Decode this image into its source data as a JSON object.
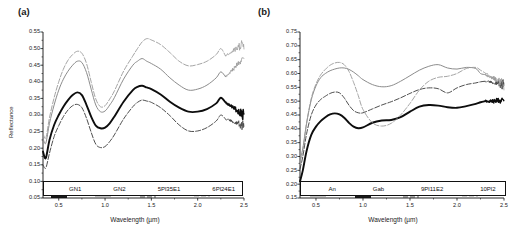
{
  "figure": {
    "panels": [
      {
        "tag": "(a)",
        "ylabel": "Reflectance",
        "xlabel": "Wavelength (µm)",
        "yticks": [
          "0.05",
          "0.10",
          "0.15",
          "0.20",
          "0.25",
          "0.30",
          "0.35",
          "0.40",
          "0.45",
          "0.50",
          "0.55"
        ],
        "xticks": [
          "0.5",
          "1.0",
          "1.5",
          "2.0",
          "2.5"
        ],
        "legend": [
          {
            "label": "GN1",
            "color": "#0d0d0d",
            "width": 1.9,
            "dash": "none"
          },
          {
            "label": "GN2",
            "color": "#8c8c8c",
            "width": 1.0,
            "dash": "none"
          },
          {
            "label": "5Pl35E1",
            "color": "#3a3a3a",
            "width": 0.9,
            "dash": "5,2"
          },
          {
            "label": "6Pl24E1",
            "color": "#9a9a9a",
            "width": 0.9,
            "dash": "5,2"
          }
        ]
      },
      {
        "tag": "(b)",
        "ylabel": "Reflectance",
        "xlabel": "Wavelength (µm)",
        "yticks": [
          "0.15",
          "0.20",
          "0.25",
          "0.30",
          "0.35",
          "0.40",
          "0.45",
          "0.50",
          "0.55",
          "0.60",
          "0.65",
          "0.70",
          "0.75"
        ],
        "xticks": [
          "0.5",
          "1.0",
          "1.5",
          "2.0",
          "2.5"
        ],
        "legend": [
          {
            "label": "An",
            "color": "#8c8c8c",
            "width": 1.0,
            "dash": "none"
          },
          {
            "label": "Gab",
            "color": "#0d0d0d",
            "width": 1.9,
            "dash": "none"
          },
          {
            "label": "9Pl11E2",
            "color": "#3a3a3a",
            "width": 0.9,
            "dash": "5,2"
          },
          {
            "label": "10Pl2",
            "color": "#9a9a9a",
            "width": 0.9,
            "dash": "5,2"
          }
        ]
      }
    ]
  },
  "chart_data": [
    {
      "type": "line",
      "title": "(a)",
      "xlabel": "Wavelength (µm)",
      "ylabel": "Reflectance",
      "xlim": [
        0.33,
        2.5
      ],
      "ylim": [
        0.05,
        0.55
      ],
      "xticks": [
        0.5,
        1.0,
        1.5,
        2.0,
        2.5
      ],
      "yticks": [
        0.05,
        0.1,
        0.15,
        0.2,
        0.25,
        0.3,
        0.35,
        0.4,
        0.45,
        0.5,
        0.55
      ],
      "grid": false,
      "legend_position": "bottom-inside",
      "x": [
        0.33,
        0.36,
        0.4,
        0.45,
        0.5,
        0.55,
        0.6,
        0.65,
        0.7,
        0.75,
        0.8,
        0.85,
        0.9,
        0.95,
        1.0,
        1.05,
        1.1,
        1.2,
        1.3,
        1.35,
        1.4,
        1.45,
        1.5,
        1.6,
        1.7,
        1.8,
        1.9,
        2.0,
        2.1,
        2.2,
        2.25,
        2.3,
        2.35,
        2.4,
        2.45,
        2.5
      ],
      "series": [
        {
          "name": "GN1",
          "color": "#0d0d0d",
          "values": [
            0.19,
            0.17,
            0.225,
            0.27,
            0.3,
            0.325,
            0.345,
            0.36,
            0.368,
            0.36,
            0.33,
            0.295,
            0.268,
            0.26,
            0.262,
            0.275,
            0.295,
            0.34,
            0.375,
            0.385,
            0.388,
            0.383,
            0.378,
            0.362,
            0.34,
            0.322,
            0.31,
            0.31,
            0.318,
            0.335,
            0.352,
            0.338,
            0.345,
            0.33,
            0.32,
            0.3
          ]
        },
        {
          "name": "GN2",
          "color": "#8c8c8c",
          "values": [
            0.23,
            0.215,
            0.275,
            0.33,
            0.375,
            0.408,
            0.432,
            0.45,
            0.462,
            0.458,
            0.428,
            0.378,
            0.33,
            0.31,
            0.312,
            0.33,
            0.352,
            0.408,
            0.45,
            0.462,
            0.47,
            0.462,
            0.455,
            0.438,
            0.412,
            0.39,
            0.375,
            0.378,
            0.39,
            0.412,
            0.43,
            0.415,
            0.44,
            0.47,
            0.49,
            0.47
          ]
        },
        {
          "name": "5Pl35E1",
          "color": "#3a3a3a",
          "values": [
            0.15,
            0.14,
            0.185,
            0.235,
            0.268,
            0.295,
            0.315,
            0.328,
            0.332,
            0.322,
            0.29,
            0.248,
            0.212,
            0.202,
            0.205,
            0.22,
            0.24,
            0.288,
            0.325,
            0.338,
            0.345,
            0.342,
            0.338,
            0.322,
            0.298,
            0.27,
            0.252,
            0.252,
            0.262,
            0.282,
            0.3,
            0.288,
            0.3,
            0.29,
            0.282,
            0.268
          ]
        },
        {
          "name": "6Pl24E1",
          "color": "#9a9a9a",
          "values": [
            0.245,
            0.23,
            0.292,
            0.352,
            0.4,
            0.438,
            0.465,
            0.482,
            0.492,
            0.486,
            0.455,
            0.4,
            0.348,
            0.325,
            0.328,
            0.348,
            0.372,
            0.432,
            0.478,
            0.5,
            0.52,
            0.53,
            0.526,
            0.512,
            0.488,
            0.462,
            0.448,
            0.452,
            0.462,
            0.482,
            0.5,
            0.478,
            0.505,
            0.53,
            0.55,
            0.515
          ]
        }
      ]
    },
    {
      "type": "line",
      "title": "(b)",
      "xlabel": "Wavelength (µm)",
      "ylabel": "Reflectance",
      "xlim": [
        0.33,
        2.5
      ],
      "ylim": [
        0.15,
        0.75
      ],
      "xticks": [
        0.5,
        1.0,
        1.5,
        2.0,
        2.5
      ],
      "yticks": [
        0.15,
        0.2,
        0.25,
        0.3,
        0.35,
        0.4,
        0.45,
        0.5,
        0.55,
        0.6,
        0.65,
        0.7,
        0.75
      ],
      "grid": false,
      "legend_position": "bottom-inside",
      "x": [
        0.33,
        0.36,
        0.4,
        0.45,
        0.5,
        0.55,
        0.6,
        0.65,
        0.7,
        0.75,
        0.8,
        0.85,
        0.9,
        0.95,
        1.0,
        1.1,
        1.2,
        1.3,
        1.4,
        1.5,
        1.6,
        1.7,
        1.8,
        1.9,
        2.0,
        2.1,
        2.2,
        2.25,
        2.3,
        2.35,
        2.4,
        2.45,
        2.5
      ],
      "series": [
        {
          "name": "An",
          "color": "#8c8c8c",
          "values": [
            0.29,
            0.33,
            0.42,
            0.505,
            0.555,
            0.585,
            0.6,
            0.61,
            0.616,
            0.62,
            0.62,
            0.615,
            0.605,
            0.592,
            0.578,
            0.56,
            0.552,
            0.556,
            0.572,
            0.592,
            0.612,
            0.626,
            0.632,
            0.62,
            0.616,
            0.622,
            0.618,
            0.6,
            0.596,
            0.592,
            0.58,
            0.57,
            0.56
          ]
        },
        {
          "name": "Gab",
          "color": "#0d0d0d",
          "values": [
            0.21,
            0.25,
            0.32,
            0.378,
            0.408,
            0.428,
            0.442,
            0.452,
            0.456,
            0.452,
            0.44,
            0.422,
            0.408,
            0.402,
            0.405,
            0.422,
            0.43,
            0.432,
            0.442,
            0.462,
            0.48,
            0.486,
            0.484,
            0.478,
            0.476,
            0.482,
            0.49,
            0.496,
            0.5,
            0.502,
            0.5,
            0.505,
            0.5
          ]
        },
        {
          "name": "9Pl11E2",
          "color": "#3a3a3a",
          "values": [
            0.255,
            0.3,
            0.382,
            0.45,
            0.486,
            0.506,
            0.518,
            0.528,
            0.533,
            0.53,
            0.512,
            0.486,
            0.466,
            0.458,
            0.458,
            0.472,
            0.486,
            0.498,
            0.512,
            0.528,
            0.542,
            0.548,
            0.545,
            0.53,
            0.548,
            0.56,
            0.566,
            0.57,
            0.572,
            0.568,
            0.566,
            0.57,
            0.56
          ]
        },
        {
          "name": "10Pl2",
          "color": "#9a9a9a",
          "values": [
            0.27,
            0.32,
            0.42,
            0.51,
            0.562,
            0.595,
            0.615,
            0.63,
            0.638,
            0.64,
            0.632,
            0.608,
            0.568,
            0.52,
            0.47,
            0.422,
            0.41,
            0.42,
            0.45,
            0.492,
            0.54,
            0.572,
            0.586,
            0.59,
            0.6,
            0.618,
            0.622,
            0.612,
            0.602,
            0.592,
            0.58,
            0.57,
            0.56
          ]
        }
      ]
    }
  ]
}
